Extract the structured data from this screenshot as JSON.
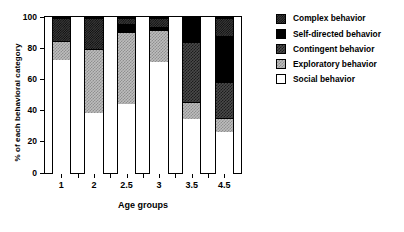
{
  "chart_data": {
    "type": "bar",
    "subtype": "stacked-bar-100",
    "title": "",
    "xlabel": "Age groups",
    "ylabel": "% of each behavioral category",
    "categories": [
      "1",
      "2",
      "2.5",
      "3",
      "3.5",
      "4.5"
    ],
    "ylim": [
      0,
      100
    ],
    "yticks": [
      0,
      20,
      40,
      60,
      80,
      100
    ],
    "grid": false,
    "legend_position": "right",
    "series": [
      {
        "name": "Social behavior",
        "key": "social",
        "fill": "white",
        "values": [
          73,
          39,
          45,
          72,
          35,
          27
        ]
      },
      {
        "name": "Exploratory behavior",
        "key": "exploratory",
        "fill": "light-checker",
        "values": [
          12.5,
          41,
          46,
          20.5,
          11,
          9
        ]
      },
      {
        "name": "Contingent behavior",
        "key": "contingent",
        "fill": "dark-checker",
        "values": [
          0,
          0,
          0,
          0,
          38.5,
          23
        ]
      },
      {
        "name": "Self-directed behavior",
        "key": "self_directed",
        "fill": "black",
        "values": [
          0,
          0,
          5,
          1.5,
          15.5,
          29.5
        ]
      },
      {
        "name": "Complex behavior",
        "key": "complex",
        "fill": "fine-checker",
        "values": [
          14.5,
          20,
          4,
          6,
          0,
          11.5
        ]
      }
    ],
    "stack_order": [
      "social",
      "exploratory",
      "contingent",
      "self_directed",
      "complex"
    ],
    "legend": [
      {
        "label": "Complex behavior",
        "key": "complex"
      },
      {
        "label": "Self-directed behavior",
        "key": "self_directed"
      },
      {
        "label": "Contingent behavior",
        "key": "contingent"
      },
      {
        "label": "Exploratory behavior",
        "key": "exploratory"
      },
      {
        "label": "Social behavior",
        "key": "social"
      }
    ],
    "colors": {
      "social": "#ffffff",
      "exploratory": "#bdbdbd",
      "contingent": "#4a4a4a",
      "self_directed": "#000000",
      "complex": "#3a3a3a",
      "axis": "#000000"
    }
  }
}
